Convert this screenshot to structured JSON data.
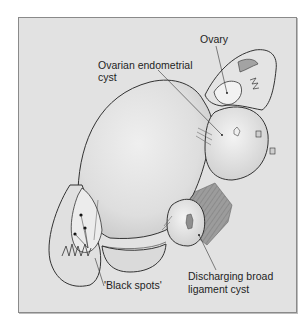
{
  "figure": {
    "type": "medical illustration",
    "labels": {
      "ovary": "Ovary",
      "ovarian_cyst_line1": "Ovarian endometrial",
      "ovarian_cyst_line2": "cyst",
      "black_spots": "'Black spots'",
      "broad_ligament_line1": "Discharging broad",
      "broad_ligament_line2": "ligament cyst"
    },
    "colors": {
      "background": "#ffffff",
      "panel_fill": "#e2e2e2",
      "panel_border": "#8a8a8a",
      "organ_fill": "#dcdcdc",
      "organ_highlight": "#eeeeee",
      "outline": "#333333",
      "shadow_tissue": "#a8a8a8"
    }
  }
}
